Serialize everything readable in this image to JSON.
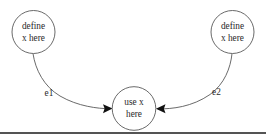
{
  "figure": {
    "background_color": "#ffffff",
    "node_stroke_color": "#595959",
    "text_color": "#2a2a2a",
    "arrow_color": "#111111",
    "rule_color": "#1b1b1b",
    "width": 266,
    "height": 140
  },
  "nodes": [
    {
      "id": "def-left",
      "line1": "define",
      "line2": "x here",
      "cx": 33.5,
      "cy": 32,
      "r": 21.5
    },
    {
      "id": "use-center",
      "line1": "use x",
      "line2": "here",
      "cx": 134,
      "cy": 108.5,
      "r": 21.8
    },
    {
      "id": "def-right",
      "line1": "define",
      "line2": "x here",
      "cx": 232.5,
      "cy": 32,
      "r": 21.5
    }
  ],
  "edges": [
    {
      "id": "e1",
      "label": "e1",
      "from": "def-left",
      "to": "use-center",
      "label_x": 49,
      "label_y": 93.5,
      "path": "M 33.0 53.6 C 35.5 70.0 44.0 86.5 60.0 96.0 C 78.0 106.5 98.0 108.6 110.0 108.8",
      "arrow_tip_x": 112.5,
      "arrow_tip_y": 108.6,
      "arrow_direction": "right"
    },
    {
      "id": "e2",
      "label": "e2",
      "from": "def-right",
      "to": "use-center",
      "label_x": 216.5,
      "label_y": 93,
      "path": "M 232.0 53.6 C 230.5 68.0 224.5 84.0 210.0 94.5 C 192.0 107.0 172.0 109.0 158.5 108.9",
      "arrow_tip_x": 156.0,
      "arrow_tip_y": 108.7,
      "arrow_direction": "left"
    }
  ],
  "rule": {
    "id": "bottom-rule",
    "x1": 0,
    "x2": 266,
    "y": 133
  }
}
